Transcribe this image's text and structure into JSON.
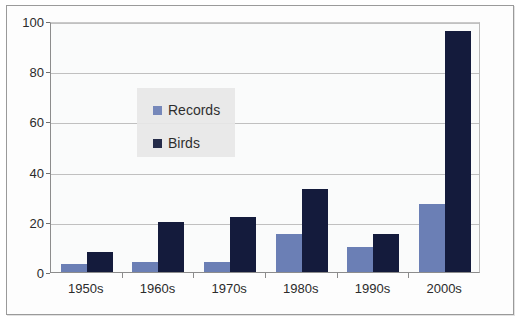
{
  "chart_data": {
    "type": "bar",
    "title": "",
    "xlabel": "",
    "ylabel": "",
    "categories": [
      "1950s",
      "1960s",
      "1970s",
      "1980s",
      "1990s",
      "2000s"
    ],
    "series": [
      {
        "name": "Records",
        "color": "#6b7fb5",
        "values": [
          3,
          4,
          4,
          15,
          10,
          27
        ]
      },
      {
        "name": "Birds",
        "color": "#141b3c",
        "values": [
          8,
          20,
          22,
          33,
          15,
          96
        ]
      }
    ],
    "ylim": [
      0,
      100
    ],
    "yticks": [
      0,
      20,
      40,
      60,
      80,
      100
    ],
    "ytick_labels": [
      "0",
      "20",
      "40",
      "60",
      "80",
      "100"
    ],
    "grid": true,
    "legend_position": "inside-upper-left",
    "plot_background": "#fafbfb",
    "gridline_color": "#c0c0c0",
    "axis_color": "#8c8c8c",
    "legend_background": "#e8e8e8"
  }
}
